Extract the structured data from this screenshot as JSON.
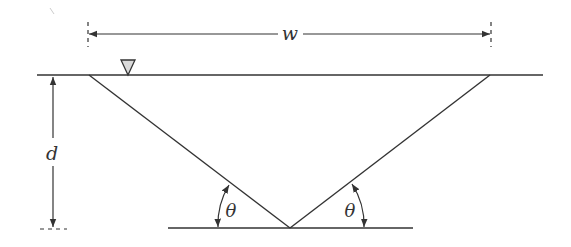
{
  "figure": {
    "type": "triangular channel cross-section",
    "labels": {
      "width": "w",
      "depth": "d",
      "angle_left": "θ",
      "angle_right": "θ"
    },
    "markers": {
      "water_surface": "free-surface-triangle"
    },
    "colors": {
      "line": "#333333",
      "marker_fill": "#d9d9d9",
      "background": "#ffffff"
    }
  }
}
